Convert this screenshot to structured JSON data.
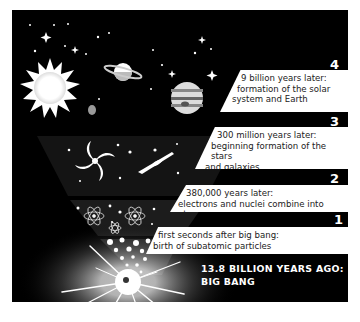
{
  "infographic": {
    "topic": "Timeline of the universe",
    "stages": [
      {
        "number": "4",
        "lines": [
          "9 billion years later:",
          "formation of the solar",
          "system and Earth"
        ],
        "illustration": "sun-planets-icon"
      },
      {
        "number": "3",
        "lines": [
          "300 million years later:",
          "beginning formation of the stars",
          "and galaxies"
        ],
        "illustration": "galaxies-icon"
      },
      {
        "number": "2",
        "lines": [
          "380,000 years later:",
          "electrons and nuclei combine into atoms"
        ],
        "illustration": "atoms-icon"
      },
      {
        "number": "1",
        "lines": [
          "first seconds after big bang:",
          "birth of subatomic particles"
        ],
        "illustration": "particles-icon"
      }
    ],
    "headline": {
      "lines": [
        "13.8 BILLION YEARS AGO:",
        "BIG BANG"
      ]
    },
    "colors": {
      "background": "#000000",
      "label_bg": "#ffffff",
      "text_dark": "#222222",
      "text_light": "#ffffff"
    }
  }
}
